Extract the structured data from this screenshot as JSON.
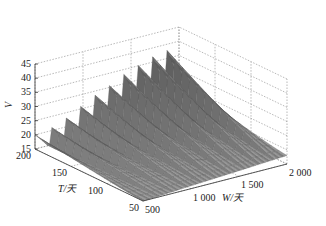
{
  "chart_data": {
    "type": "surface3d",
    "title": "",
    "xlabel": "W/天",
    "ylabel": "T/天",
    "zlabel": "V",
    "x_ticks": [
      "500",
      "1 000",
      "1 500",
      "2 000"
    ],
    "y_ticks": [
      "50",
      "100",
      "150",
      "200"
    ],
    "z_ticks": [
      "15",
      "20",
      "25",
      "30",
      "35",
      "40",
      "45"
    ],
    "xlim": [
      500,
      2000
    ],
    "ylim": [
      50,
      200
    ],
    "zlim": [
      15,
      45
    ],
    "grid": true,
    "colormap": "gray",
    "series": [
      {
        "name": "ridge_peaks_at_T200",
        "W": [
          500,
          650,
          800,
          950,
          1100,
          1250,
          1400,
          1550,
          1700,
          1850,
          2000
        ],
        "V": [
          20,
          22,
          24,
          27,
          30,
          32,
          35,
          37,
          39,
          40,
          41
        ]
      }
    ]
  }
}
